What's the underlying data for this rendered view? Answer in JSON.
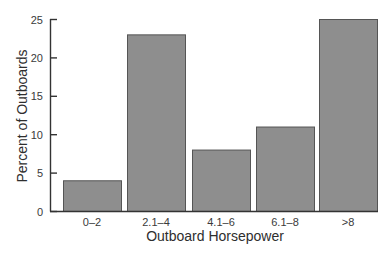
{
  "chart_data": {
    "type": "bar",
    "title": "",
    "xlabel": "Outboard Horsepower",
    "ylabel": "Percent of Outboards",
    "categories": [
      "0–2",
      "2.1–4",
      "4.1–6",
      "6.1–8",
      ">8"
    ],
    "values": [
      4,
      23,
      8,
      11,
      25
    ],
    "ylim": [
      0,
      25
    ],
    "yticks": [
      0,
      5,
      10,
      15,
      20,
      25
    ],
    "grid": false,
    "legend": null,
    "colors": {
      "bar_fill": "#8e8e8e",
      "bar_stroke": "#555555",
      "axis": "#333333"
    }
  }
}
